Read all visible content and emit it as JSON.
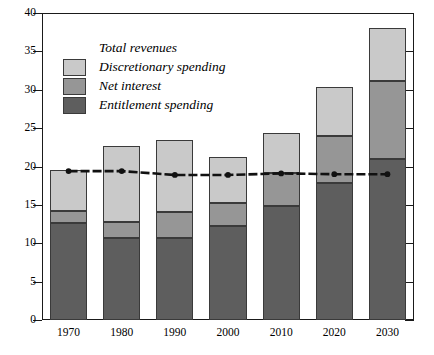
{
  "chart_data": {
    "type": "bar",
    "subtype": "stacked-bar-with-line-overlay",
    "title": "",
    "xlabel": "",
    "ylabel": "",
    "categories": [
      "1970",
      "1980",
      "1990",
      "2000",
      "2010",
      "2020",
      "2030"
    ],
    "ylim": [
      0,
      40
    ],
    "ytick_step": 5,
    "yticks": [
      "0",
      "5",
      "10",
      "15",
      "20",
      "25",
      "30",
      "35",
      "40"
    ],
    "grid": false,
    "legend_position": "upper-left-inside",
    "series": [
      {
        "name": "Entitlement spending",
        "type": "bar-segment",
        "color": "#5e5e5e",
        "values": [
          12.6,
          10.7,
          10.7,
          12.3,
          14.8,
          17.9,
          21.0
        ]
      },
      {
        "name": "Net interest",
        "type": "bar-segment",
        "color": "#969696",
        "values": [
          1.6,
          2.1,
          3.4,
          2.9,
          4.3,
          6.1,
          10.2
        ]
      },
      {
        "name": "Discretionary spending",
        "type": "bar-segment",
        "color": "#c9c9c9",
        "values": [
          5.4,
          9.9,
          9.4,
          6.0,
          5.3,
          6.4,
          6.9
        ]
      },
      {
        "name": "Total revenues",
        "type": "line",
        "color": "#111111",
        "values": [
          19.4,
          19.4,
          18.9,
          18.9,
          19.1,
          19.0,
          19.0
        ]
      }
    ],
    "stack_tops": {
      "entitlement": [
        12.6,
        10.7,
        10.7,
        12.3,
        14.8,
        17.9,
        21.0
      ],
      "net_interest": [
        14.2,
        12.8,
        14.1,
        15.2,
        19.1,
        24.0,
        31.2
      ],
      "total": [
        19.6,
        22.7,
        23.5,
        21.2,
        24.4,
        30.4,
        38.1
      ]
    }
  },
  "legend": {
    "items": [
      {
        "label": "Total revenues",
        "marker": "line",
        "color": "#111111"
      },
      {
        "label": "Discretionary spending",
        "marker": "swatch",
        "color": "#c9c9c9"
      },
      {
        "label": "Net interest",
        "marker": "swatch",
        "color": "#969696"
      },
      {
        "label": "Entitlement spending",
        "marker": "swatch",
        "color": "#5e5e5e"
      }
    ]
  }
}
